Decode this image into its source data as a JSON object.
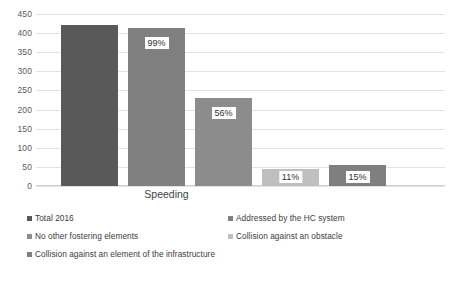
{
  "chart_data": {
    "type": "bar",
    "title": "",
    "xlabel": "",
    "ylabel": "",
    "categories": [
      "Speeding"
    ],
    "ylim": [
      0,
      450
    ],
    "ytick_step": 50,
    "yticks": [
      "450",
      "400",
      "350",
      "300",
      "250",
      "200",
      "150",
      "100",
      "50",
      "0"
    ],
    "grid": true,
    "legend_position": "bottom",
    "series": [
      {
        "name": "Total 2016",
        "values": [
          420
        ],
        "data_label": "",
        "color": "#595959"
      },
      {
        "name": "Addressed by the HC system",
        "values": [
          414
        ],
        "data_label": "99%",
        "color": "#808080"
      },
      {
        "name": "No other fostering elements",
        "values": [
          230
        ],
        "data_label": "56%",
        "color": "#8c8c8c"
      },
      {
        "name": "Collision against an obstacle",
        "values": [
          45
        ],
        "data_label": "11%",
        "color": "#bfbfbf"
      },
      {
        "name": "Collision against an element of the infrastructure",
        "values": [
          55
        ],
        "data_label": "15%",
        "color": "#7f7f7f"
      }
    ]
  },
  "axis": {
    "category_label": "Speeding"
  },
  "legend": {
    "items": [
      {
        "label": "Total 2016",
        "color": "#595959"
      },
      {
        "label": "Addressed by the HC system",
        "color": "#808080"
      },
      {
        "label": "No other fostering elements",
        "color": "#8c8c8c"
      },
      {
        "label": "Collision against an obstacle",
        "color": "#bfbfbf"
      },
      {
        "label": "Collision against an element of the infrastructure",
        "color": "#7f7f7f"
      }
    ]
  }
}
